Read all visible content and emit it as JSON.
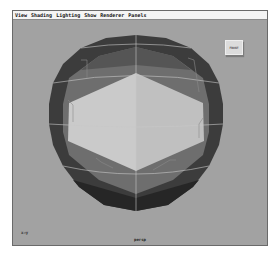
{
  "menubar": {
    "items": [
      {
        "label": "View"
      },
      {
        "label": "Shading"
      },
      {
        "label": "Lighting"
      },
      {
        "label": "Show"
      },
      {
        "label": "Renderer"
      },
      {
        "label": "Panels"
      }
    ]
  },
  "viewport": {
    "background_color": "#a2a2a2",
    "camera_label": "persp",
    "axis_label": "x→y",
    "viewcube_label": "FRONT",
    "object": {
      "type": "polySphere",
      "shading_colors": {
        "lit_face_left": "#cacaca",
        "lit_face_right": "#c2c2c2",
        "mid_ring": "#6e6e6e",
        "outer_ring": "#3c3c3c",
        "wire": "#c8c8c8"
      }
    }
  }
}
